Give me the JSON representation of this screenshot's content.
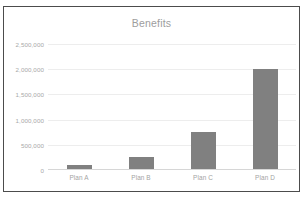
{
  "chart_data": {
    "type": "bar",
    "title": "Benefits",
    "xlabel": "",
    "ylabel": "",
    "categories": [
      "Plan A",
      "Plan B",
      "Plan C",
      "Plan D"
    ],
    "values": [
      100000,
      250000,
      750000,
      2000000
    ],
    "ylim": [
      0,
      2500000
    ],
    "y_ticks": [
      0,
      500000,
      1000000,
      1500000,
      2000000,
      2500000
    ],
    "y_tick_labels": [
      "0",
      "500,000",
      "1,000,000",
      "1,500,000",
      "2,000,000",
      "2,500,000"
    ],
    "grid": true,
    "legend": false,
    "series": [
      {
        "name": "Benefits",
        "values": [
          100000,
          250000,
          750000,
          2000000
        ]
      }
    ],
    "colors": {
      "bar": "#808080",
      "gridline": "#ededed",
      "axis": "#d6d6d6",
      "tick_label": "#a8a8a8",
      "title": "#9d9d9d",
      "border": "#4c4c4c",
      "background": "#ffffff"
    }
  }
}
